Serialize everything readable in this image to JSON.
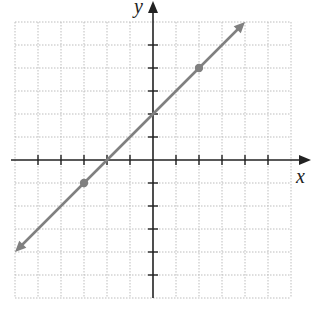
{
  "chart_data": {
    "type": "line",
    "title": "",
    "xlabel": "x",
    "ylabel": "y",
    "xlim": [
      -6,
      6
    ],
    "ylim": [
      -6,
      6
    ],
    "grid": true,
    "tick_spacing": 1,
    "tick_labels": false,
    "series": [
      {
        "name": "line",
        "equation": "y = x + 2",
        "slope": 1,
        "intercept": 2,
        "x": [
          -6,
          4
        ],
        "y": [
          -4,
          6
        ],
        "arrows_both_ends": true,
        "color": "#808080"
      }
    ],
    "points": [
      {
        "x": -3,
        "y": -1
      },
      {
        "x": 2,
        "y": 4
      }
    ]
  },
  "labels": {
    "x_axis": "x",
    "y_axis": "y"
  },
  "colors": {
    "axis": "#222222",
    "grid": "#bdbdbd",
    "line": "#808080"
  }
}
